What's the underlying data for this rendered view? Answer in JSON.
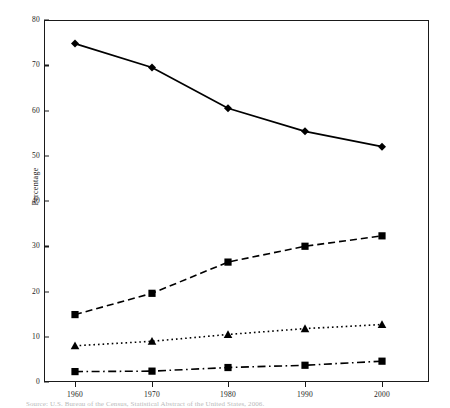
{
  "chart_data": {
    "type": "line",
    "title": "",
    "xlabel": "",
    "ylabel": "Percentage",
    "categories": [
      "1960",
      "1970",
      "1980",
      "1990",
      "2000"
    ],
    "x": [
      1960,
      1970,
      1980,
      1990,
      2000
    ],
    "xlim": [
      1955,
      2005
    ],
    "ylim": [
      0,
      80
    ],
    "ytick_labels": [
      "0",
      "10",
      "20",
      "30",
      "40",
      "50",
      "60",
      "70",
      "80"
    ],
    "yticks": [
      0,
      10,
      20,
      30,
      40,
      50,
      60,
      70,
      80
    ],
    "ytick_step": 10,
    "grid": false,
    "legend": "none",
    "series": [
      {
        "name": "series-1",
        "marker": "diamond",
        "line_style": "solid",
        "color": "#000000",
        "values": [
          74.8,
          69.5,
          60.5,
          55.4,
          52.0
        ]
      },
      {
        "name": "series-2",
        "marker": "square",
        "line_style": "dashed",
        "color": "#000000",
        "values": [
          14.9,
          19.6,
          26.5,
          30.0,
          32.3
        ]
      },
      {
        "name": "series-3",
        "marker": "triangle",
        "line_style": "dotted",
        "color": "#000000",
        "values": [
          8.0,
          9.0,
          10.5,
          11.8,
          12.7
        ]
      },
      {
        "name": "series-4",
        "marker": "square",
        "line_style": "dashdot",
        "color": "#000000",
        "values": [
          2.3,
          2.4,
          3.2,
          3.7,
          4.6
        ]
      }
    ]
  },
  "caption": "Source: U.S. Bureau of the Census, Statistical Abstract of the United States, 2006."
}
